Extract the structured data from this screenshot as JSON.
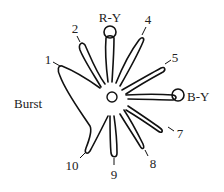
{
  "diagram": {
    "center_label": "",
    "labels": {
      "burst": "Burst",
      "ry": "R-Y",
      "by": "B-Y",
      "v1": "1",
      "v2": "2",
      "v4": "4",
      "v5": "5",
      "v7": "7",
      "v8": "8",
      "v9": "9",
      "v10": "10"
    },
    "colors": {
      "stroke": "#111111",
      "text": "#222222",
      "background": "#ffffff"
    }
  }
}
